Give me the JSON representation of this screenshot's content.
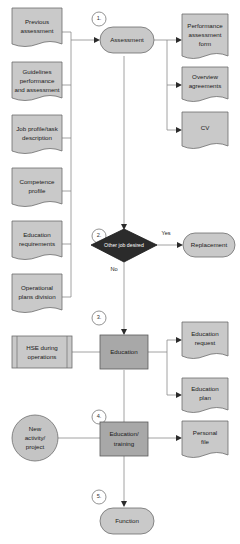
{
  "diagram": {
    "colors": {
      "document_fill": "#c9c9c9",
      "process_fill": "#a8a8a8",
      "decision_fill": "#2b2b2b",
      "terminator_fill": "#c9c9c9",
      "border": "#6d6d6d",
      "connector": "#8a8a8a",
      "background": "#ffffff"
    },
    "inputs_left": [
      {
        "id": "previous-assessment",
        "label": "Previous\nassessment",
        "shape": "document"
      },
      {
        "id": "guidelines-performance-and-assessment",
        "label": "Guidelines\nperformance\nand assessment",
        "shape": "document"
      },
      {
        "id": "job-profile-task-description",
        "label": "Job profile/task\ndescription",
        "shape": "document"
      },
      {
        "id": "competence-profile",
        "label": "Competence\nprofile",
        "shape": "document"
      },
      {
        "id": "education-requirements",
        "label": "Education\nrequirements",
        "shape": "document"
      },
      {
        "id": "operational-plans-division",
        "label": "Operational\nplans division",
        "shape": "document"
      }
    ],
    "steps": [
      {
        "number": "1.",
        "id": "assessment",
        "label": "Assessment",
        "shape": "terminator"
      },
      {
        "number": "2.",
        "id": "other-job-desired",
        "label": "Other job desired",
        "shape": "decision"
      },
      {
        "number": "3.",
        "id": "education",
        "label": "Education",
        "shape": "process"
      },
      {
        "number": "4.",
        "id": "education-training",
        "label": "Education/\ntraining",
        "shape": "process"
      },
      {
        "number": "5.",
        "id": "function",
        "label": "Function",
        "shape": "terminator"
      }
    ],
    "outputs_right": [
      {
        "id": "performance-assessment-form",
        "label": "Performance\nassessment\nform",
        "shape": "document",
        "from": "assessment"
      },
      {
        "id": "overview-agreements",
        "label": "Overview\nagreements",
        "shape": "document",
        "from": "assessment"
      },
      {
        "id": "cv",
        "label": "CV",
        "shape": "document",
        "from": "assessment"
      },
      {
        "id": "replacement",
        "label": "Replacement",
        "shape": "terminator",
        "from": "other-job-desired"
      },
      {
        "id": "education-request",
        "label": "Education\nrequest",
        "shape": "document",
        "from": "education"
      },
      {
        "id": "education-plan",
        "label": "Education\nplan",
        "shape": "document",
        "from": "education"
      },
      {
        "id": "personal-file",
        "label": "Personal\nfile",
        "shape": "document",
        "from": "education-training"
      }
    ],
    "other_inputs": [
      {
        "id": "hse-during-operations",
        "label": "HSE during\noperations",
        "shape": "predefined-process",
        "to": "education"
      },
      {
        "id": "new-activity-project",
        "label": "New\nactivity/\nproject",
        "shape": "circle",
        "to": "education-training"
      }
    ],
    "edge_labels": {
      "yes": "Yes",
      "no": "No"
    },
    "text": {
      "previous_assessment_l1": "Previous",
      "previous_assessment_l2": "assessment",
      "guidelines_l1": "Guidelines",
      "guidelines_l2": "performance",
      "guidelines_l3": "and assessment",
      "job_profile_l1": "Job profile/task",
      "job_profile_l2": "description",
      "competence_l1": "Competence",
      "competence_l2": "profile",
      "education_req_l1": "Education",
      "education_req_l2": "requirements",
      "operational_l1": "Operational",
      "operational_l2": "plans division",
      "hse_l1": "HSE during",
      "hse_l2": "operations",
      "new_activity_l1": "New",
      "new_activity_l2": "activity/",
      "new_activity_l3": "project",
      "assessment": "Assessment",
      "other_job_desired": "Other job desired",
      "education": "Education",
      "education_training_l1": "Education/",
      "education_training_l2": "training",
      "function": "Function",
      "replacement": "Replacement",
      "perf_form_l1": "Performance",
      "perf_form_l2": "assessment",
      "perf_form_l3": "form",
      "overview_l1": "Overview",
      "overview_l2": "agreements",
      "cv": "CV",
      "edu_request_l1": "Education",
      "edu_request_l2": "request",
      "edu_plan_l1": "Education",
      "edu_plan_l2": "plan",
      "personal_file_l1": "Personal",
      "personal_file_l2": "file",
      "step1": "1.",
      "step2": "2.",
      "step3": "3.",
      "step4": "4.",
      "step5": "5.",
      "yes": "Yes",
      "no": "No"
    }
  }
}
